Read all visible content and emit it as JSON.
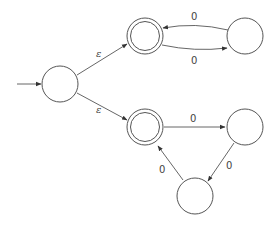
{
  "diagram": {
    "type": "nfa-state-diagram",
    "colors": {
      "stroke": "#555555",
      "text": "#444444",
      "background": "#ffffff"
    },
    "states": [
      {
        "id": "q0",
        "label": "",
        "x": 60,
        "y": 84,
        "accepting": false,
        "start": true
      },
      {
        "id": "q1",
        "label": "",
        "x": 145,
        "y": 36,
        "accepting": true,
        "start": false
      },
      {
        "id": "q2",
        "label": "",
        "x": 245,
        "y": 36,
        "accepting": false,
        "start": false
      },
      {
        "id": "q3",
        "label": "",
        "x": 145,
        "y": 127,
        "accepting": true,
        "start": false
      },
      {
        "id": "q4",
        "label": "",
        "x": 245,
        "y": 127,
        "accepting": false,
        "start": false
      },
      {
        "id": "q5",
        "label": "",
        "x": 195,
        "y": 196,
        "accepting": false,
        "start": false
      }
    ],
    "transitions": [
      {
        "from": "q0",
        "to": "q1",
        "label": "ε"
      },
      {
        "from": "q0",
        "to": "q3",
        "label": "ε"
      },
      {
        "from": "q1",
        "to": "q2",
        "label": "0"
      },
      {
        "from": "q2",
        "to": "q1",
        "label": "0"
      },
      {
        "from": "q3",
        "to": "q4",
        "label": "0"
      },
      {
        "from": "q4",
        "to": "q5",
        "label": "0"
      },
      {
        "from": "q5",
        "to": "q3",
        "label": "0"
      }
    ],
    "labels": {
      "eps_top": "ε",
      "eps_bottom": "ε",
      "q2_to_q1": "0",
      "q1_to_q2": "0",
      "q3_to_q4": "0",
      "q4_to_q5": "0",
      "q5_to_q3": "0"
    }
  }
}
